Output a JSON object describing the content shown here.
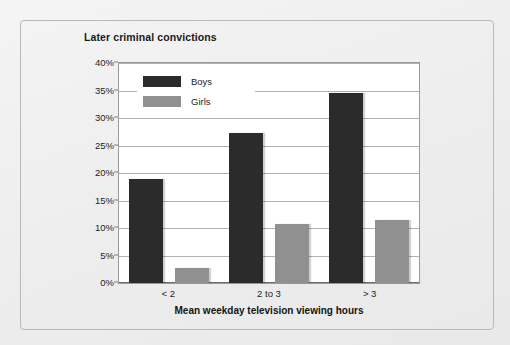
{
  "chart_data": {
    "type": "bar",
    "title": "Later criminal convictions",
    "xlabel": "Mean weekday television viewing hours",
    "ylabel": "",
    "categories": [
      "< 2",
      "2 to 3",
      "> 3"
    ],
    "series": [
      {
        "name": "Boys",
        "color": "#2b2b2b",
        "values": [
          19.0,
          27.2,
          34.5
        ]
      },
      {
        "name": "Girls",
        "color": "#909090",
        "values": [
          2.7,
          10.7,
          11.5
        ]
      }
    ],
    "ylim": [
      0,
      40
    ],
    "ytick_step": 5,
    "ytick_labels": [
      "0%",
      "5%",
      "10%",
      "15%",
      "20%",
      "25%",
      "30%",
      "35%",
      "40%"
    ],
    "grid": true,
    "legend_position": "top-left-inside"
  }
}
